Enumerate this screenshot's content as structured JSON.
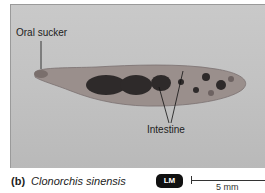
{
  "figure": {
    "panel_letter": "(b)",
    "species": "Clonorchis sinensis",
    "microscopy_badge": "LM",
    "scale_bar_label": "5 mm"
  },
  "labels": {
    "oral_sucker": "Oral sucker",
    "intestine": "Intestine"
  },
  "colors": {
    "background_grey": "#c4c4c4",
    "badge_bg": "#111111",
    "text": "#222222"
  }
}
